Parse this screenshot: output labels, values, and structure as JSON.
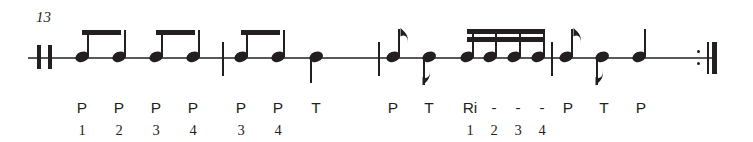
{
  "document": {
    "type": "rhythm-notation-exercise",
    "measure_number": "13",
    "width": 753,
    "height": 142,
    "ink_color": "#231f20",
    "staff_color": "#58595b"
  },
  "staff": {
    "line_y": 57,
    "start_x": 28,
    "end_x": 712
  },
  "barlines": [
    {
      "name": "opening-double-barline",
      "kind": "double-thin",
      "x": 38
    },
    {
      "name": "barline-1",
      "kind": "thin",
      "x": 222
    },
    {
      "name": "barline-2",
      "kind": "thin",
      "x": 378
    },
    {
      "name": "barline-3",
      "kind": "thin",
      "x": 551
    },
    {
      "name": "final-repeat-barline",
      "kind": "end-repeat",
      "x": 700
    }
  ],
  "notes": [
    {
      "id": "n1",
      "x": 82,
      "duration": "eighth",
      "stem": "up",
      "beamed": true,
      "beam_group": 1,
      "label": "P",
      "count": "1"
    },
    {
      "id": "n2",
      "x": 119,
      "duration": "eighth",
      "stem": "up",
      "beamed": true,
      "beam_group": 1,
      "label": "P",
      "count": "2"
    },
    {
      "id": "n3",
      "x": 156,
      "duration": "eighth",
      "stem": "up",
      "beamed": true,
      "beam_group": 2,
      "label": "P",
      "count": "3"
    },
    {
      "id": "n4",
      "x": 193,
      "duration": "eighth",
      "stem": "up",
      "beamed": true,
      "beam_group": 2,
      "label": "P",
      "count": "4"
    },
    {
      "id": "n5",
      "x": 241,
      "duration": "eighth",
      "stem": "up",
      "beamed": true,
      "beam_group": 3,
      "label": "P",
      "count": "3"
    },
    {
      "id": "n6",
      "x": 278,
      "duration": "eighth",
      "stem": "up",
      "beamed": true,
      "beam_group": 3,
      "label": "P",
      "count": "4"
    },
    {
      "id": "n7",
      "x": 316,
      "duration": "quarter",
      "stem": "down",
      "beamed": false,
      "label": "T",
      "count": ""
    },
    {
      "id": "n8",
      "x": 393,
      "duration": "eighth",
      "stem": "up",
      "beamed": false,
      "flag": true,
      "label": "P",
      "count": ""
    },
    {
      "id": "n9",
      "x": 429,
      "duration": "eighth",
      "stem": "down",
      "beamed": false,
      "flag": true,
      "label": "T",
      "count": ""
    },
    {
      "id": "n10",
      "x": 467,
      "duration": "sixteenth",
      "stem": "up",
      "beamed": true,
      "beam_group": 4,
      "label": "Ri",
      "count": "1"
    },
    {
      "id": "n11",
      "x": 490,
      "duration": "sixteenth",
      "stem": "up",
      "beamed": true,
      "beam_group": 4,
      "label": "-",
      "count": "2"
    },
    {
      "id": "n12",
      "x": 514,
      "duration": "sixteenth",
      "stem": "up",
      "beamed": true,
      "beam_group": 4,
      "label": "-",
      "count": "3"
    },
    {
      "id": "n13",
      "x": 538,
      "duration": "sixteenth",
      "stem": "up",
      "beamed": true,
      "beam_group": 4,
      "label": "-",
      "count": "4"
    },
    {
      "id": "n14",
      "x": 566,
      "duration": "eighth",
      "stem": "up",
      "beamed": false,
      "flag": true,
      "label": "P",
      "count": ""
    },
    {
      "id": "n15",
      "x": 602,
      "duration": "eighth",
      "stem": "down",
      "beamed": false,
      "flag": true,
      "label": "T",
      "count": ""
    },
    {
      "id": "n16",
      "x": 639,
      "duration": "quarter",
      "stem": "up",
      "beamed": false,
      "label": "P",
      "count": ""
    }
  ],
  "beams": [
    {
      "group": 1,
      "x1": 82,
      "x2": 119,
      "y": 31,
      "lines": 1
    },
    {
      "group": 2,
      "x1": 156,
      "x2": 193,
      "y": 31,
      "lines": 1
    },
    {
      "group": 3,
      "x1": 241,
      "x2": 278,
      "y": 31,
      "lines": 1
    },
    {
      "group": 4,
      "x1": 467,
      "x2": 538,
      "y": 30,
      "lines": 2
    }
  ],
  "labels": {
    "row_y": 100,
    "count_row_y": 123,
    "sticking": [
      "P",
      "P",
      "P",
      "P",
      "P",
      "P",
      "T",
      "P",
      "T",
      "Ri",
      "-",
      "-",
      "-",
      "P",
      "T",
      "P"
    ],
    "counts": [
      "1",
      "2",
      "3",
      "4",
      "3",
      "4",
      "",
      "",
      "",
      "1",
      "2",
      "3",
      "4",
      "",
      "",
      ""
    ]
  }
}
